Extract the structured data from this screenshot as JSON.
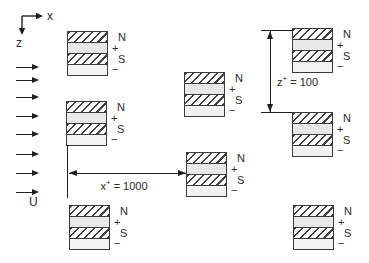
{
  "diagram": {
    "axes": {
      "x_label": "x",
      "z_label": "z"
    },
    "flow": {
      "velocity_label": "U",
      "arrow_count": 8
    },
    "dimensions": {
      "x_spacing": {
        "symbol": "x",
        "superscript": "+",
        "rest": " = 1000"
      },
      "z_spacing": {
        "symbol": "z",
        "superscript": "+",
        "rest": " = 100"
      }
    },
    "stacks": [
      {
        "placement": "left-top",
        "n": "N",
        "plus": "+",
        "s": "S",
        "minus": "−"
      },
      {
        "placement": "left-middle",
        "n": "N",
        "plus": "+",
        "s": "S",
        "minus": "−"
      },
      {
        "placement": "center-upper",
        "n": "N",
        "plus": "+",
        "s": "S",
        "minus": "−"
      },
      {
        "placement": "center-lower",
        "n": "N",
        "plus": "+",
        "s": "S",
        "minus": "−"
      },
      {
        "placement": "right-top",
        "n": "N",
        "plus": "+",
        "s": "S",
        "minus": "−"
      },
      {
        "placement": "right-middle",
        "n": "N",
        "plus": "+",
        "s": "S",
        "minus": "−"
      },
      {
        "placement": "left-bottom",
        "n": "N",
        "plus": "+",
        "s": "S",
        "minus": "−"
      },
      {
        "placement": "right-bottom",
        "n": "N",
        "plus": "+",
        "s": "S",
        "minus": "−"
      }
    ],
    "colors": {
      "line": "#1f1f1f",
      "electrode_fill": "#e8e8e8",
      "electrode_fill_light": "#f3f3f3",
      "background": "#ffffff"
    }
  }
}
